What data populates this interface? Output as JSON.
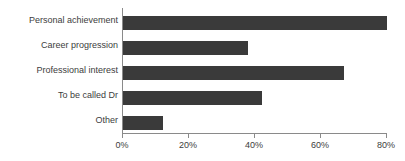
{
  "chart_data": {
    "type": "bar",
    "orientation": "horizontal",
    "title": "",
    "xlabel": "",
    "ylabel": "",
    "categories": [
      "Personal achievement",
      "Career progression",
      "Professional interest",
      "To be called Dr",
      "Other"
    ],
    "values": [
      80,
      38,
      67,
      42,
      12
    ],
    "value_suffix": "%",
    "xlim": [
      0,
      80
    ],
    "xticks": [
      0,
      20,
      40,
      60,
      80
    ],
    "xtick_labels": [
      "0%",
      "20%",
      "40%",
      "60%",
      "80%"
    ],
    "grid": false,
    "legend": null,
    "bar_color": "#3a3a3a",
    "axis_color": "#8a8a8a",
    "text_color": "#3d3d3d"
  }
}
